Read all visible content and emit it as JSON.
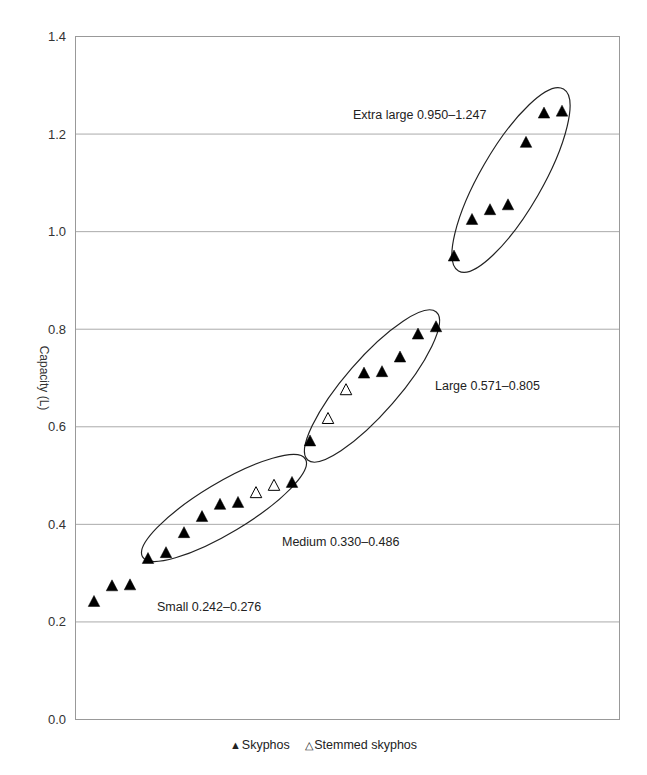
{
  "chart_data": {
    "type": "scatter",
    "title": "",
    "xlabel": "",
    "ylabel": "Capacity (L)",
    "ylim": [
      0,
      1.4
    ],
    "yticks": [
      "0.0",
      "0.2",
      "0.4",
      "0.6",
      "0.8",
      "1.0",
      "1.2",
      "1.4"
    ],
    "grid": "horizontal",
    "legend_position": "bottom",
    "x_axis_labels": false,
    "series": [
      {
        "name": "Skyphos",
        "marker": "filled-triangle",
        "points": [
          {
            "i": 1,
            "y": 0.242
          },
          {
            "i": 2,
            "y": 0.274
          },
          {
            "i": 3,
            "y": 0.276
          },
          {
            "i": 4,
            "y": 0.33
          },
          {
            "i": 5,
            "y": 0.342
          },
          {
            "i": 6,
            "y": 0.383
          },
          {
            "i": 7,
            "y": 0.416
          },
          {
            "i": 8,
            "y": 0.441
          },
          {
            "i": 9,
            "y": 0.445
          },
          {
            "i": 12,
            "y": 0.486
          },
          {
            "i": 13,
            "y": 0.571
          },
          {
            "i": 16,
            "y": 0.71
          },
          {
            "i": 17,
            "y": 0.713
          },
          {
            "i": 18,
            "y": 0.743
          },
          {
            "i": 19,
            "y": 0.79
          },
          {
            "i": 20,
            "y": 0.805
          },
          {
            "i": 21,
            "y": 0.95
          },
          {
            "i": 22,
            "y": 1.025
          },
          {
            "i": 23,
            "y": 1.045
          },
          {
            "i": 24,
            "y": 1.055
          },
          {
            "i": 25,
            "y": 1.183
          },
          {
            "i": 26,
            "y": 1.243
          },
          {
            "i": 27,
            "y": 1.247
          }
        ]
      },
      {
        "name": "Stemmed skyphos",
        "marker": "open-triangle",
        "points": [
          {
            "i": 10,
            "y": 0.465
          },
          {
            "i": 11,
            "y": 0.48
          },
          {
            "i": 14,
            "y": 0.617
          },
          {
            "i": 15,
            "y": 0.676
          }
        ]
      }
    ],
    "groups": [
      {
        "name": "Small",
        "label": "Small 0.242–0.276",
        "range": [
          0.242,
          0.276
        ],
        "encircled": false
      },
      {
        "name": "Medium",
        "label": "Medium 0.330–0.486",
        "range": [
          0.33,
          0.486
        ],
        "encircled": true
      },
      {
        "name": "Large",
        "label": "Large 0.571–0.805",
        "range": [
          0.571,
          0.805
        ],
        "encircled": true
      },
      {
        "name": "Extra large",
        "label": "Extra large 0.950–1.247",
        "range": [
          0.95,
          1.247
        ],
        "encircled": true
      }
    ]
  },
  "legend": {
    "items": [
      {
        "glyph": "▲",
        "label": "Skyphos"
      },
      {
        "glyph": "△",
        "label": "Stemmed skyphos"
      }
    ]
  },
  "colors": {
    "marker": "#000000",
    "grid": "#aaaaaa",
    "axis": "#999999",
    "text": "#222222"
  }
}
